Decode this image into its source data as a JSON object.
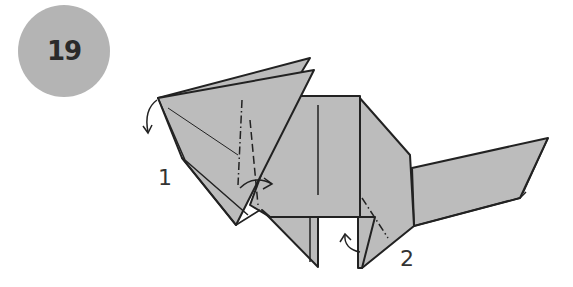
{
  "step": {
    "number": "19"
  },
  "labels": {
    "annotation_1": "1",
    "annotation_2": "2"
  },
  "colors": {
    "paper": "#bcbcbc",
    "outline": "#222222",
    "badge": "#b4b4b4"
  },
  "icons": [
    "valley-fold-arrow-icon",
    "mountain-fold-arrow-icon",
    "rotate-arrow-icon"
  ]
}
